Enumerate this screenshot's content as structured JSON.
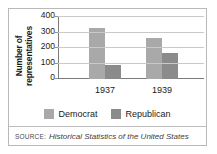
{
  "chart_data": {
    "type": "bar",
    "title": "",
    "xlabel": "",
    "ylabel": "Number of representatives",
    "categories": [
      "1937",
      "1939"
    ],
    "series": [
      {
        "name": "Democrat",
        "color": "#a9a9a9",
        "values": [
          331,
          262
        ]
      },
      {
        "name": "Republican",
        "color": "#8b8b8b",
        "values": [
          89,
          169
        ]
      }
    ],
    "ylim": [
      0,
      400
    ],
    "yticks": [
      400,
      300,
      200,
      100,
      0
    ],
    "grid": true,
    "legend_position": "bottom"
  },
  "axis": {
    "y_title_line1": "Number of",
    "y_title_line2": "representatives",
    "ytick_labels": [
      "400",
      "300",
      "200",
      "100",
      "0"
    ],
    "xtick_labels": [
      "1937",
      "1939"
    ]
  },
  "legend": {
    "items": [
      {
        "label": "Democrat",
        "color": "#a9a9a9"
      },
      {
        "label": "Republican",
        "color": "#8b8b8b"
      }
    ]
  },
  "source": {
    "label": "SOURCE:",
    "text": "Historical Statistics of the United States"
  }
}
